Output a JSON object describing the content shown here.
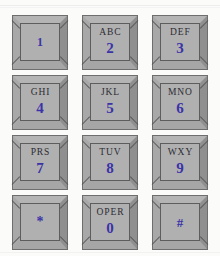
{
  "keypad": {
    "title": "Telephone Keypad",
    "colors": {
      "background": "#fbfbfa",
      "key_face": "#b0b0b0",
      "key_bevel": "#9d9d9d",
      "key_outline": "#5d5d5d",
      "digit_color": "#3b33a8",
      "letter_color": "#2c2c33"
    },
    "keys": [
      {
        "digit": "1",
        "letters": "",
        "name": "key-1"
      },
      {
        "digit": "2",
        "letters": "ABC",
        "name": "key-2"
      },
      {
        "digit": "3",
        "letters": "DEF",
        "name": "key-3"
      },
      {
        "digit": "4",
        "letters": "GHI",
        "name": "key-4"
      },
      {
        "digit": "5",
        "letters": "JKL",
        "name": "key-5"
      },
      {
        "digit": "6",
        "letters": "MNO",
        "name": "key-6"
      },
      {
        "digit": "7",
        "letters": "PRS",
        "name": "key-7"
      },
      {
        "digit": "8",
        "letters": "TUV",
        "name": "key-8"
      },
      {
        "digit": "9",
        "letters": "WXY",
        "name": "key-9"
      },
      {
        "digit": "*",
        "letters": "",
        "name": "key-star"
      },
      {
        "digit": "0",
        "letters": "OPER",
        "name": "key-0"
      },
      {
        "digit": "#",
        "letters": "",
        "name": "key-pound"
      }
    ]
  }
}
